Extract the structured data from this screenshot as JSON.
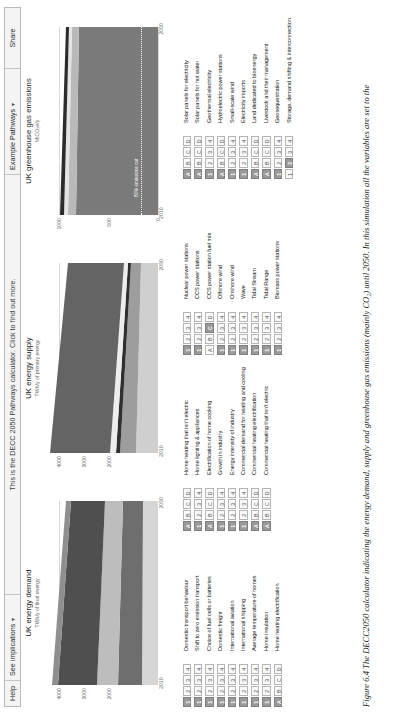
{
  "topbar": {
    "help": "Help",
    "implications": "See implications",
    "implications_caret": "▾",
    "hint": "This is the DECC 2050 Pathways calculator. Click to find out more.",
    "example_pathways": "Example Pathways",
    "example_caret": "▾",
    "share": "Share"
  },
  "charts": [
    {
      "id": "uk-energy-demand",
      "title": "UK energy demand",
      "subtitle": "TWh/y of final energy",
      "yticks": [
        "4000",
        "3000",
        "2000"
      ],
      "ylim": [
        0,
        4600
      ],
      "xticks": [
        "2010",
        "2050"
      ],
      "xlim": [
        2010,
        2050
      ]
    },
    {
      "id": "uk-energy-supply",
      "title": "UK energy supply",
      "subtitle": "TWh/y of primary energy",
      "yticks": [
        "4000",
        "3000",
        "2000"
      ],
      "ylim": [
        0,
        4600
      ],
      "xticks": [
        "2010",
        "2050"
      ],
      "xlim": [
        2010,
        2050
      ]
    },
    {
      "id": "uk-greenhouse-gas-emissions",
      "title": "UK greenhouse gas emissions",
      "subtitle": "MtCO₂e/y",
      "yticks": [
        "1000",
        "500",
        "0"
      ],
      "ylim": [
        0,
        1100
      ],
      "xticks": [
        "2010",
        "2050"
      ],
      "xlim": [
        2010,
        2050
      ],
      "target_label": "80% emissions cut"
    }
  ],
  "chart_data": [
    {
      "type": "area",
      "title": "UK energy demand",
      "ylabel": "TWh/y of final energy",
      "xlabel": "",
      "x": [
        2010,
        2050
      ],
      "ylim": [
        0,
        4600
      ],
      "xlim": [
        2010,
        2050
      ],
      "yticks": [
        4000,
        3000,
        2000
      ],
      "xticks": [
        2010,
        2050
      ],
      "grid": true,
      "legend": "none",
      "series": [
        {
          "name": "Transport",
          "values": [
            700,
            620
          ],
          "color": "#8f8f8f"
        },
        {
          "name": "Heating and cooling",
          "values": [
            800,
            700
          ],
          "color": "#4f4f4f"
        },
        {
          "name": "Lighting & appliances",
          "values": [
            430,
            380
          ],
          "color": "#bdbdbd"
        },
        {
          "name": "Industry",
          "values": [
            430,
            340
          ],
          "color": "#6e6e6e"
        },
        {
          "name": "Losses / other",
          "values": [
            140,
            100
          ],
          "color": "#d6d6d6"
        }
      ],
      "totals": [
        2500,
        2140
      ]
    },
    {
      "type": "area",
      "title": "UK energy supply",
      "ylabel": "TWh/y of primary energy",
      "xlabel": "",
      "x": [
        2010,
        2050
      ],
      "ylim": [
        0,
        4600
      ],
      "xlim": [
        2010,
        2050
      ],
      "yticks": [
        4000,
        3000,
        2000
      ],
      "xticks": [
        2010,
        2050
      ],
      "grid": true,
      "legend": "none",
      "series": [
        {
          "name": "Fossil fuels",
          "values": [
            2300,
            1700
          ],
          "color": "#646464"
        },
        {
          "name": "Nuclear",
          "values": [
            120,
            120
          ],
          "color": "#ededed"
        },
        {
          "name": "Renewables",
          "values": [
            90,
            80
          ],
          "color": "#2f2f2f"
        },
        {
          "name": "Bioenergy",
          "values": [
            180,
            140
          ],
          "color": "#9d9d9d"
        },
        {
          "name": "Imports",
          "values": [
            110,
            90
          ],
          "color": "#cfcfcf"
        }
      ],
      "totals": [
        2800,
        2130
      ]
    },
    {
      "type": "area",
      "title": "UK greenhouse gas emissions",
      "ylabel": "MtCO₂e/y",
      "xlabel": "",
      "x": [
        2010,
        2050
      ],
      "ylim": [
        0,
        1100
      ],
      "xlim": [
        2010,
        2050
      ],
      "yticks": [
        1000,
        500,
        0
      ],
      "xticks": [
        2010,
        2050
      ],
      "grid": true,
      "legend": "none",
      "annotations": [
        {
          "text": "80% emissions cut",
          "y": 160
        }
      ],
      "series": [
        {
          "name": "Emissions",
          "values": [
            700,
            610
          ],
          "color": "#7a7a7a"
        },
        {
          "name": "Agriculture & waste",
          "values": [
            70,
            62
          ],
          "color": "#b9b9b9"
        },
        {
          "name": "Industrial processes",
          "values": [
            35,
            30
          ],
          "color": "#e3e3e3"
        },
        {
          "name": "Other",
          "values": [
            25,
            20
          ],
          "color": "#2b2b2b"
        }
      ],
      "totals": [
        830,
        722
      ]
    }
  ],
  "lever_columns": [
    {
      "id": "demand-transport",
      "levers": [
        {
          "name": "Domestic transport behaviour",
          "options": [
            "1",
            "2",
            "3",
            "4"
          ],
          "selected": 0
        },
        {
          "name": "Shift to zero emission transport",
          "options": [
            "1",
            "2",
            "3",
            "4"
          ],
          "selected": 0
        },
        {
          "name": "Choice of fuel cells or batteries",
          "options": [
            "1",
            "2",
            "3",
            "4"
          ],
          "selected": 0
        },
        {
          "name": "Domestic freight",
          "options": [
            "1",
            "2",
            "3",
            "4"
          ],
          "selected": 0
        },
        {
          "name": "International aviation",
          "options": [
            "1",
            "2",
            "3",
            "4"
          ],
          "selected": 0
        },
        {
          "name": "International shipping",
          "options": [
            "1",
            "2",
            "3",
            "4"
          ],
          "selected": 0
        },
        {
          "name": "Average temperature of homes",
          "options": [
            "1",
            "2",
            "3",
            "4"
          ],
          "selected": 0
        },
        {
          "name": "Home insulation",
          "options": [
            "1",
            "2",
            "3",
            "4"
          ],
          "selected": 0
        },
        {
          "name": "Home heating electrification",
          "options": [
            "A",
            "B",
            "C",
            "D"
          ],
          "selected": 0
        },
        {
          "name": "Home heating that isn't electric",
          "options": [
            "A",
            "B",
            "C",
            "D"
          ],
          "selected": 0
        },
        {
          "name": "Home lighting & appliances",
          "options": [
            "1",
            "2",
            "3",
            "4"
          ],
          "selected": 0
        },
        {
          "name": "Electrification of home cooking",
          "options": [
            "A",
            "B",
            "C",
            "D"
          ],
          "selected": 0
        },
        {
          "name": "Growth in industry",
          "options": [
            "1",
            "2",
            "3",
            "4"
          ],
          "selected": 0
        },
        {
          "name": "Energy intensity of industry",
          "options": [
            "1",
            "2",
            "3",
            "4"
          ],
          "selected": 0
        },
        {
          "name": "Commercial demand for heating and cooling",
          "options": [
            "1",
            "2",
            "3",
            "4"
          ],
          "selected": 0
        },
        {
          "name": "Commercial heating electrification",
          "options": [
            "A",
            "B",
            "C",
            "D"
          ],
          "selected": 0
        },
        {
          "name": "Commercial heating that isn't electric",
          "options": [
            "A",
            "B",
            "C",
            "D"
          ],
          "selected": 0
        }
      ]
    },
    {
      "id": "supply",
      "levers": [
        {
          "name": "Nuclear power stations",
          "options": [
            "1",
            "2",
            "3",
            "4"
          ],
          "selected": 0
        },
        {
          "name": "CCS power stations",
          "options": [
            "1",
            "2",
            "3",
            "4"
          ],
          "selected": 0
        },
        {
          "name": "CCS power station fuel mix",
          "options": [
            "A",
            "B",
            "C",
            "D"
          ],
          "selected": 2
        },
        {
          "name": "Offshore wind",
          "options": [
            "1",
            "2",
            "3",
            "4"
          ],
          "selected": 0
        },
        {
          "name": "Onshore wind",
          "options": [
            "1",
            "2",
            "3",
            "4"
          ],
          "selected": 0
        },
        {
          "name": "Wave",
          "options": [
            "1",
            "2",
            "3",
            "4"
          ],
          "selected": 0
        },
        {
          "name": "Tidal Stream",
          "options": [
            "1",
            "2",
            "3",
            "4"
          ],
          "selected": 0
        },
        {
          "name": "Tidal Range",
          "options": [
            "1",
            "2",
            "3",
            "4"
          ],
          "selected": 0
        },
        {
          "name": "Biomass power stations",
          "options": [
            "1",
            "2",
            "3",
            "4"
          ],
          "selected": 0
        },
        {
          "name": "Solar panels for electricity",
          "options": [
            "A",
            "B",
            "C",
            "D"
          ],
          "selected": 0
        },
        {
          "name": "Solar panels for hot water",
          "options": [
            "A",
            "B",
            "C",
            "D"
          ],
          "selected": 0
        },
        {
          "name": "Geothermal electricity",
          "options": [
            "1",
            "2",
            "3",
            "4"
          ],
          "selected": 0
        },
        {
          "name": "Hydroelectric power stations",
          "options": [
            "A",
            "B",
            "C",
            "D"
          ],
          "selected": 0
        },
        {
          "name": "Small-scale wind",
          "options": [
            "1",
            "2",
            "3",
            "4"
          ],
          "selected": 0
        },
        {
          "name": "Electricity imports",
          "options": [
            "1",
            "2",
            "3",
            "4"
          ],
          "selected": 0
        },
        {
          "name": "Land dedicated to bioenergy",
          "options": [
            "A",
            "B",
            "C",
            "D"
          ],
          "selected": 0
        },
        {
          "name": "Livestock and their management",
          "options": [
            "A",
            "B",
            "C",
            "D"
          ],
          "selected": 0
        }
      ]
    },
    {
      "id": "other",
      "levers": [
        {
          "name": "Geosequestration",
          "options": [
            "1",
            "2",
            "3",
            "4"
          ],
          "selected": 0
        },
        {
          "name": "Storage, demand shifting & interconnection",
          "options": [
            "1",
            "2",
            "3",
            "4"
          ],
          "selected": 1
        }
      ]
    }
  ],
  "caption": {
    "figure_number": "Figure 6.4",
    "text": "The DECC2050 calculator indicating the energy demand, supply and greenhouse gas emissions (mainly CO₂) until 2050. In this simulation all the variables are set to the"
  }
}
